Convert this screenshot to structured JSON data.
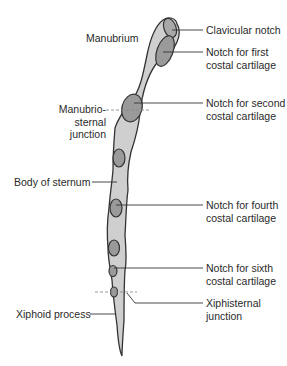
{
  "diagram": {
    "colors": {
      "bone_fill": "#cfcfcf",
      "bone_outline": "#333333",
      "notch_fill": "#9a9a9a",
      "leader_line": "#333333",
      "dashed_line": "#8a8a8a",
      "text": "#2a2a2a",
      "background": "#ffffff"
    },
    "labels": {
      "manubrium": "Manubrium",
      "clavicular_notch": "Clavicular notch",
      "notch_first_l1": "Notch for first",
      "notch_first_l2": "costal cartilage",
      "manubriosternal_l1": "Manubrio-",
      "manubriosternal_l2": "sternal",
      "manubriosternal_l3": "junction",
      "notch_second_l1": "Notch for second",
      "notch_second_l2": "costal cartilage",
      "body_of_sternum": "Body of sternum",
      "notch_fourth_l1": "Notch for fourth",
      "notch_fourth_l2": "costal cartilage",
      "notch_sixth_l1": "Notch for sixth",
      "notch_sixth_l2": "costal cartilage",
      "xiphoid_process": "Xiphoid process",
      "xiphisternal_l1": "Xiphisternal",
      "xiphisternal_l2": "junction"
    }
  }
}
